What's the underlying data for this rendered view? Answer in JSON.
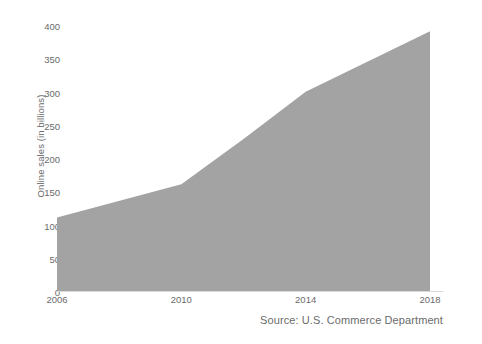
{
  "chart_data": {
    "type": "area",
    "title": "",
    "subtitle": "",
    "xlabel": "",
    "ylabel": "Online sales (in billions)",
    "x": [
      2006,
      2010,
      2012,
      2014,
      2018
    ],
    "values": [
      112,
      162,
      230,
      301,
      392
    ],
    "series": [
      {
        "name": "Online sales",
        "values": [
          112,
          162,
          230,
          301,
          392
        ]
      }
    ],
    "categories": [
      "2006",
      "2010",
      "2012",
      "2014",
      "2018"
    ],
    "xlim": [
      2006,
      2018
    ],
    "ylim": [
      0,
      400
    ],
    "xticks": [
      2006,
      2010,
      2014,
      2018
    ],
    "xtick_labels": [
      "2006",
      "2010",
      "2014",
      "2018"
    ],
    "yticks": [
      0,
      50,
      100,
      150,
      200,
      250,
      300,
      350,
      400
    ],
    "ytick_labels": [
      "0",
      "50",
      "100",
      "150",
      "200",
      "250",
      "300",
      "350",
      "400"
    ],
    "grid": false,
    "legend": null,
    "legend_position": "none",
    "annotations": [
      "Source: U.S. Commerce Department"
    ],
    "colors": {
      "area_fill": "#a3a3a3",
      "axis_line": "#d9d9d9",
      "tick_text": "#6b6b6b",
      "background": "#ffffff"
    }
  },
  "axes": {
    "y_label": "Online sales (in billions)",
    "y_ticks": [
      {
        "label": "400",
        "value": 400
      },
      {
        "label": "350",
        "value": 350
      },
      {
        "label": "300",
        "value": 300
      },
      {
        "label": "250",
        "value": 250
      },
      {
        "label": "200",
        "value": 200
      },
      {
        "label": "150",
        "value": 150
      },
      {
        "label": "100",
        "value": 100
      },
      {
        "label": "50",
        "value": 50
      },
      {
        "label": "0",
        "value": 0
      }
    ],
    "x_ticks": [
      {
        "label": "2006",
        "value": 2006
      },
      {
        "label": "2010",
        "value": 2010
      },
      {
        "label": "2014",
        "value": 2014
      },
      {
        "label": "2018",
        "value": 2018
      }
    ]
  },
  "footer": {
    "source": "Source: U.S. Commerce Department"
  }
}
